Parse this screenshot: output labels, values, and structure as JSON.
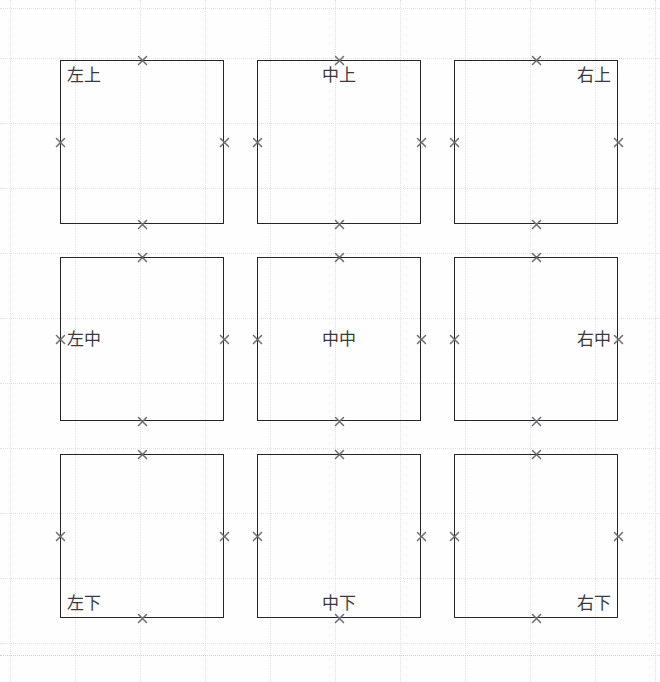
{
  "diagram": {
    "canvas": {
      "width": 660,
      "height": 682,
      "background": "#fefefe"
    },
    "style": {
      "box_stroke": "#26262a",
      "marker_color": "#6b6b70",
      "grid_color": "#e2e2e4",
      "label_color": "#3a3a3e"
    },
    "geometry": {
      "box_size": 164,
      "gap": 33,
      "origin_x": 60,
      "origin_y": 60
    },
    "cells": [
      {
        "label": "左上",
        "valign": "top",
        "halign": "left",
        "row": 0,
        "col": 0
      },
      {
        "label": "中上",
        "valign": "top",
        "halign": "center",
        "row": 0,
        "col": 1
      },
      {
        "label": "右上",
        "valign": "top",
        "halign": "right",
        "row": 0,
        "col": 2
      },
      {
        "label": "左中",
        "valign": "middle",
        "halign": "left",
        "row": 1,
        "col": 0
      },
      {
        "label": "中中",
        "valign": "middle",
        "halign": "center",
        "row": 1,
        "col": 1
      },
      {
        "label": "右中",
        "valign": "middle",
        "halign": "right",
        "row": 1,
        "col": 2
      },
      {
        "label": "左下",
        "valign": "bottom",
        "halign": "left",
        "row": 2,
        "col": 0
      },
      {
        "label": "中下",
        "valign": "bottom",
        "halign": "center",
        "row": 2,
        "col": 1
      },
      {
        "label": "右下",
        "valign": "bottom",
        "halign": "right",
        "row": 2,
        "col": 2
      }
    ],
    "grid": {
      "v_lines": [
        10,
        75,
        140,
        205,
        270,
        335,
        400,
        465,
        530,
        595,
        655
      ],
      "h_lines": [
        8,
        58,
        123,
        188,
        253,
        318,
        383,
        448,
        513,
        578,
        643,
        655
      ]
    }
  }
}
